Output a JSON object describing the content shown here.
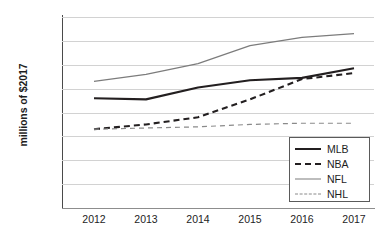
{
  "chart_data": {
    "type": "line",
    "title": "",
    "xlabel": "",
    "ylabel": "millions of $2017",
    "categories": [
      "2012",
      "2013",
      "2014",
      "2015",
      "2016",
      "2017"
    ],
    "x": [
      2012,
      2013,
      2014,
      2015,
      2016,
      2017
    ],
    "ylim": [
      0,
      160
    ],
    "yticks": [
      "0",
      "20",
      "40",
      "60",
      "80",
      "100",
      "120",
      "140",
      "160"
    ],
    "ytick_values": [
      0,
      20,
      40,
      60,
      80,
      100,
      120,
      140,
      160
    ],
    "grid": true,
    "legend_position": "bottom-right",
    "series": [
      {
        "name": "MLB",
        "values": [
          92,
          91,
          101,
          107,
          109,
          117
        ],
        "color": "#231f20",
        "style": "solid",
        "width": 2.1
      },
      {
        "name": "NBA",
        "values": [
          66,
          70,
          76,
          91,
          108,
          113
        ],
        "color": "#231f20",
        "style": "dashed",
        "width": 2.1
      },
      {
        "name": "NFL",
        "values": [
          106,
          112,
          121,
          136,
          143,
          146
        ],
        "color": "#7c7c7c",
        "style": "solid",
        "width": 1.2
      },
      {
        "name": "NHL",
        "values": [
          66,
          67,
          68,
          70,
          71,
          71
        ],
        "color": "#8a8a8a",
        "style": "dashed",
        "width": 1.2
      }
    ]
  },
  "colors": {
    "grid": "#d2d2d2",
    "axis": "#4a4a4a",
    "text": "#1d1d1d",
    "background": "#ffffff"
  }
}
